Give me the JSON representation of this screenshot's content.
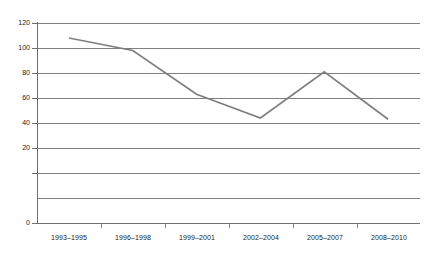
{
  "chart_data": {
    "type": "line",
    "title": "",
    "subtitle": "",
    "xlabel": "",
    "ylabel": "",
    "categories": [
      "1993–1995",
      "1996–1998",
      "1999–2001",
      "2002–2004",
      "2005–2007",
      "2008–2010"
    ],
    "values": [
      108,
      98,
      63,
      44,
      81,
      43
    ],
    "series": [
      {
        "name": "",
        "values": [
          108,
          98,
          63,
          44,
          81,
          43
        ]
      }
    ],
    "ylim": [
      0,
      120
    ],
    "ytick_values": [
      0,
      20,
      40,
      60,
      80,
      100,
      120
    ],
    "ytick_labels": [
      "0",
      "20",
      "40",
      "60",
      "80",
      "100",
      "120"
    ],
    "grid": "horizontal",
    "legend": "none",
    "line_color": "#7f7f7f",
    "grid_color": "#808080",
    "axis_color": "#6f6f6f",
    "background_color": "#ffffff",
    "text_color": "#1a1a1a",
    "markers": "none"
  }
}
